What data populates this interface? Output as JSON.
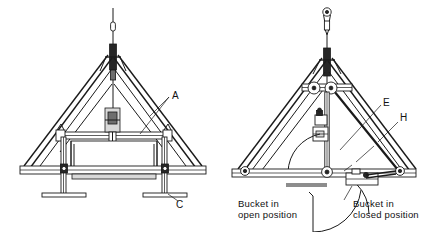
{
  "figure": {
    "background_color": "#ffffff",
    "line_color": "#1a1a1a"
  },
  "views": [
    {
      "id": "left-view",
      "name": "bucket-open-frame-view",
      "callouts": [
        {
          "id": "A",
          "label": "A",
          "x": 174,
          "y": 97
        },
        {
          "id": "C",
          "label": "C",
          "x": 180,
          "y": 204
        }
      ]
    },
    {
      "id": "right-view",
      "name": "bucket-closed-frame-view",
      "callouts": [
        {
          "id": "E",
          "label": "E",
          "x": 385,
          "y": 103
        },
        {
          "id": "H",
          "label": "H",
          "x": 402,
          "y": 118
        }
      ]
    }
  ],
  "captions": [
    {
      "id": "caption-open",
      "line1": "Bucket in",
      "line2": "open position",
      "x": 238,
      "y": 205
    },
    {
      "id": "caption-closed",
      "line1": "Bucket in",
      "line2": "closed position",
      "x": 353,
      "y": 205
    }
  ],
  "colors": {
    "stroke": "#1a1a1a",
    "dark_fill": "#262626",
    "mid_fill": "#6e6e6e",
    "light_fill": "#d9d9d9",
    "paper": "#ffffff"
  }
}
